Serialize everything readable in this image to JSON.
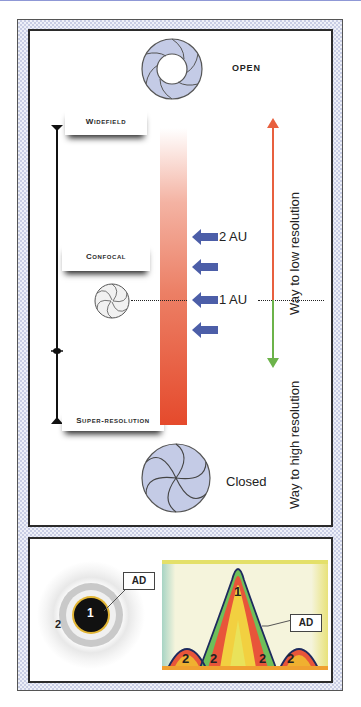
{
  "diagram": {
    "top_panel": {
      "pinhole_open_label": "OPEN",
      "pinhole_closed_label": "Closed",
      "mode_labels": {
        "widefield": "Widefield",
        "confocal": "Confocal",
        "super_resolution": "Super-resolution"
      },
      "aperture_markers": [
        {
          "label": "2 AU"
        },
        {
          "label": ""
        },
        {
          "label": "1 AU"
        },
        {
          "label": ""
        }
      ],
      "low_resolution_label": "Way to low resolution",
      "high_resolution_label": "Way to high resolution",
      "colors": {
        "up_arrow": "#e8603f",
        "down_arrow": "#6cb34a",
        "marker_arrow": "#4c5ea8",
        "pinhole_fill": "#c4cbe6",
        "gradient_bar_bottom": "#e54a2c"
      }
    },
    "bottom_panel": {
      "airy_disk": {
        "center_label": "1",
        "ring_label": "2",
        "callout": "AD"
      },
      "profile_plot": {
        "peak_label": "1",
        "side_labels": [
          "2",
          "2",
          "2",
          "2"
        ],
        "callout": "AD"
      }
    }
  }
}
